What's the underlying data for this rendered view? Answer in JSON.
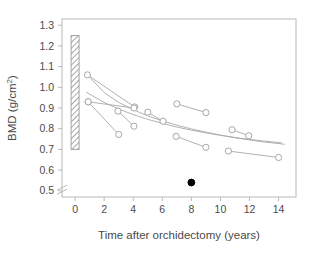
{
  "figure": {
    "background": "#ffffff",
    "frame_color": "#b9b9b9",
    "marker_color": "#a8a8a8",
    "curve_color": "#a8a8a8",
    "filled_marker_color": "#000000",
    "text_color": "#4a4a4a",
    "hatch_color": "#9a9a9a"
  },
  "chart_data": {
    "type": "scatter",
    "title": "",
    "subtitle": "",
    "xlabel": "Time after orchidectomy (years)",
    "ylabel": "BMD (g/cm2)",
    "ylabel_display": "BMD (g/cm",
    "ylabel_sup": "2",
    "ylabel_tail": ")",
    "xlim": [
      -0.9,
      15.2
    ],
    "ylim": [
      0.47,
      1.33
    ],
    "xticks": [
      0,
      2,
      4,
      6,
      8,
      10,
      12,
      14
    ],
    "xticklabels": [
      "0",
      "2",
      "4",
      "6",
      "8",
      "10",
      "12",
      "14"
    ],
    "yticks": [
      0.5,
      0.6,
      0.7,
      0.8,
      0.9,
      1.0,
      1.1,
      1.2,
      1.3
    ],
    "yticklabels": [
      "0.5",
      "0.6",
      "0.7",
      "0.8",
      "0.9",
      "1.0",
      "1.1",
      "1.2",
      "1.3"
    ],
    "grid": false,
    "legend": false,
    "axis_break": {
      "present": true,
      "axis": "y",
      "between": [
        0.6,
        0.7
      ],
      "marks_at_y": 0.515,
      "note": "double slash break marks drawn on y-axis near 0.5"
    },
    "reference_bar": {
      "label": "normal range",
      "x": 0,
      "y_low": 0.7,
      "y_high": 1.25,
      "style": "diagonal hatch",
      "width_years": 0.55
    },
    "series": [
      {
        "name": "Paired open-circle observations",
        "marker": "open-circle",
        "pairs": [
          {
            "id": "p1",
            "points": [
              {
                "x": 0.85,
                "y": 1.06
              },
              {
                "x": 4.1,
                "y": 0.905
              }
            ]
          },
          {
            "id": "p2",
            "points": [
              {
                "x": 0.9,
                "y": 0.93
              },
              {
                "x": 4.05,
                "y": 0.9
              }
            ]
          },
          {
            "id": "p3",
            "points": [
              {
                "x": 0.9,
                "y": 0.93
              },
              {
                "x": 3.0,
                "y": 0.772
              }
            ]
          },
          {
            "id": "p4",
            "points": [
              {
                "x": 2.95,
                "y": 0.885
              },
              {
                "x": 4.05,
                "y": 0.812
              }
            ]
          },
          {
            "id": "p5",
            "points": [
              {
                "x": 5.0,
                "y": 0.88
              },
              {
                "x": 6.05,
                "y": 0.836
              }
            ]
          },
          {
            "id": "p6",
            "points": [
              {
                "x": 7.0,
                "y": 0.92
              },
              {
                "x": 9.0,
                "y": 0.878
              }
            ]
          },
          {
            "id": "p7",
            "points": [
              {
                "x": 6.95,
                "y": 0.763
              },
              {
                "x": 9.0,
                "y": 0.71
              }
            ]
          },
          {
            "id": "p8",
            "points": [
              {
                "x": 10.8,
                "y": 0.795
              },
              {
                "x": 11.95,
                "y": 0.766
              }
            ]
          },
          {
            "id": "p9",
            "points": [
              {
                "x": 10.55,
                "y": 0.692
              },
              {
                "x": 14.0,
                "y": 0.661
              }
            ]
          }
        ]
      },
      {
        "name": "Single filled observation",
        "marker": "filled-circle",
        "points": [
          {
            "x": 8.0,
            "y": 0.54
          }
        ]
      }
    ],
    "curves": [
      {
        "name": "upper fitted curve",
        "points": [
          {
            "x": 0.8,
            "y": 0.975
          },
          {
            "x": 2.0,
            "y": 0.927
          },
          {
            "x": 3.0,
            "y": 0.895
          },
          {
            "x": 4.0,
            "y": 0.868
          },
          {
            "x": 5.0,
            "y": 0.845
          },
          {
            "x": 6.0,
            "y": 0.826
          },
          {
            "x": 7.0,
            "y": 0.808
          },
          {
            "x": 8.0,
            "y": 0.793
          },
          {
            "x": 9.0,
            "y": 0.78
          },
          {
            "x": 10.0,
            "y": 0.768
          },
          {
            "x": 11.0,
            "y": 0.757
          },
          {
            "x": 12.0,
            "y": 0.748
          },
          {
            "x": 13.0,
            "y": 0.74
          },
          {
            "x": 14.2,
            "y": 0.732
          }
        ]
      },
      {
        "name": "lower fitted curve",
        "points": [
          {
            "x": 0.85,
            "y": 1.06
          },
          {
            "x": 2.0,
            "y": 0.975
          },
          {
            "x": 3.0,
            "y": 0.927
          },
          {
            "x": 4.0,
            "y": 0.892
          },
          {
            "x": 5.0,
            "y": 0.862
          },
          {
            "x": 6.0,
            "y": 0.838
          },
          {
            "x": 7.0,
            "y": 0.817
          },
          {
            "x": 8.0,
            "y": 0.799
          },
          {
            "x": 9.0,
            "y": 0.783
          },
          {
            "x": 10.0,
            "y": 0.769
          },
          {
            "x": 11.0,
            "y": 0.757
          },
          {
            "x": 12.0,
            "y": 0.746
          },
          {
            "x": 13.0,
            "y": 0.736
          },
          {
            "x": 14.4,
            "y": 0.725
          }
        ]
      }
    ]
  }
}
